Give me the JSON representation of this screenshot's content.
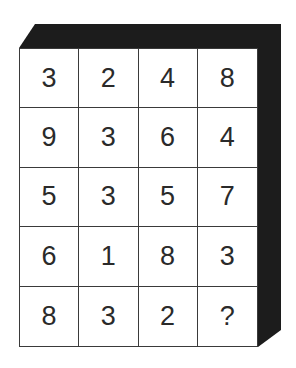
{
  "puzzle": {
    "colors": {
      "extrusion": "#1c1c1c",
      "grid_line": "#3a3a3a",
      "text": "#2a2a2a",
      "background": "#ffffff"
    },
    "rows": [
      [
        "3",
        "2",
        "4",
        "8"
      ],
      [
        "9",
        "3",
        "6",
        "4"
      ],
      [
        "5",
        "3",
        "5",
        "7"
      ],
      [
        "6",
        "1",
        "8",
        "3"
      ],
      [
        "8",
        "3",
        "2",
        "?"
      ]
    ]
  }
}
